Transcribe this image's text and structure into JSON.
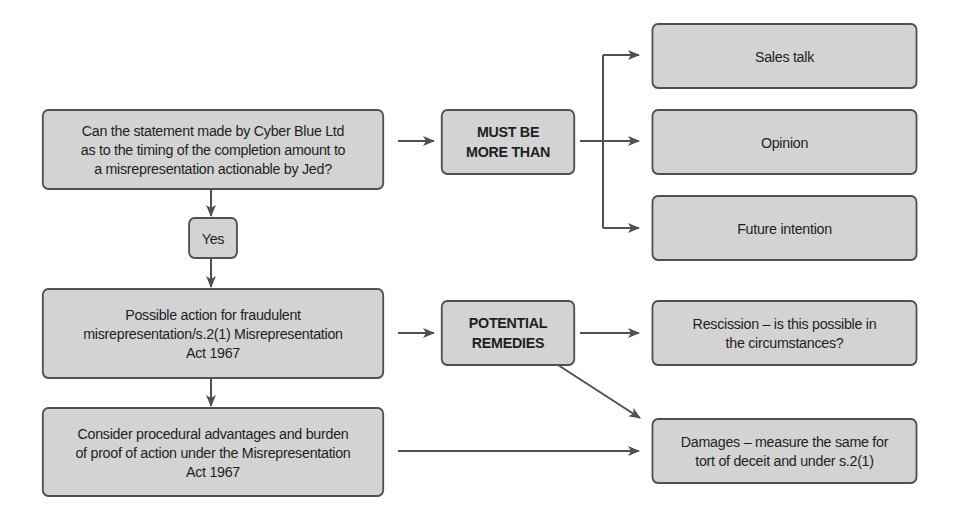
{
  "diagram": {
    "type": "flowchart",
    "colors": {
      "box_fill": "#d3d3d3",
      "box_border": "#505050",
      "connector": "#505050",
      "background": "#ffffff"
    },
    "nodes": {
      "question": {
        "label": "Can the statement made by Cyber Blue Ltd\nas to the timing of the completion amount to\na misrepresentation actionable by Jed?"
      },
      "must_be_more_than": {
        "label": "MUST BE\nMORE THAN"
      },
      "sales_talk": {
        "label": "Sales talk"
      },
      "opinion": {
        "label": "Opinion"
      },
      "future_intention": {
        "label": "Future intention"
      },
      "yes": {
        "label": "Yes"
      },
      "possible_action": {
        "label": "Possible action for fraudulent\nmisrepresentation/s.2(1) Misrepresentation\nAct 1967"
      },
      "potential_remedies": {
        "label": "POTENTIAL\nREMEDIES"
      },
      "rescission": {
        "label": "Rescission – is this possible in\nthe circumstances?"
      },
      "consider_procedural": {
        "label": "Consider procedural advantages and burden\nof proof of action under the Misrepresentation\nAct 1967"
      },
      "damages": {
        "label": "Damages – measure the same for\ntort of deceit and under s.2(1)"
      }
    },
    "edges": [
      {
        "from": "question",
        "to": "must_be_more_than"
      },
      {
        "from": "must_be_more_than",
        "to": "sales_talk"
      },
      {
        "from": "must_be_more_than",
        "to": "opinion"
      },
      {
        "from": "must_be_more_than",
        "to": "future_intention"
      },
      {
        "from": "question",
        "to": "yes"
      },
      {
        "from": "yes",
        "to": "possible_action"
      },
      {
        "from": "possible_action",
        "to": "potential_remedies"
      },
      {
        "from": "potential_remedies",
        "to": "rescission"
      },
      {
        "from": "potential_remedies",
        "to": "damages"
      },
      {
        "from": "possible_action",
        "to": "consider_procedural"
      },
      {
        "from": "consider_procedural",
        "to": "damages"
      }
    ]
  }
}
